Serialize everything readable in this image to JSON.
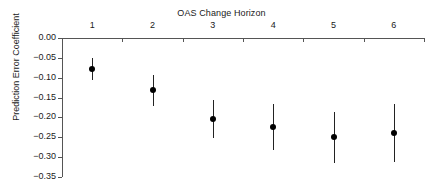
{
  "chart_data": {
    "type": "scatter",
    "title": "OAS Change Horizon",
    "xlabel": "OAS Change Horizon",
    "ylabel": "Prediction Error Coefficient",
    "x_axis_position": "top",
    "grid": false,
    "legend": "none",
    "categories": [
      "1",
      "2",
      "3",
      "4",
      "5",
      "6"
    ],
    "x": [
      1,
      2,
      3,
      4,
      5,
      6
    ],
    "values": [
      -0.078,
      -0.131,
      -0.205,
      -0.224,
      -0.25,
      -0.239
    ],
    "error_low": [
      -0.107,
      -0.171,
      -0.253,
      -0.282,
      -0.315,
      -0.312
    ],
    "error_high": [
      -0.05,
      -0.093,
      -0.155,
      -0.166,
      -0.186,
      -0.165
    ],
    "xlim": [
      0.5,
      6.5
    ],
    "ylim": [
      -0.35,
      0.0
    ],
    "y_ticks": [
      "0.00",
      "-0.05",
      "-0.10",
      "-0.15",
      "-0.20",
      "-0.25",
      "-0.30",
      "-0.35"
    ],
    "y_tick_values": [
      0.0,
      -0.05,
      -0.1,
      -0.15,
      -0.2,
      -0.25,
      -0.3,
      -0.35
    ],
    "x_ticks": [
      "1",
      "2",
      "3",
      "4",
      "5",
      "6"
    ],
    "marker": "filled-circle",
    "marker_color": "#000000",
    "errorbar_color": "#222222",
    "axis_color": "#555555",
    "background": "#ffffff"
  }
}
